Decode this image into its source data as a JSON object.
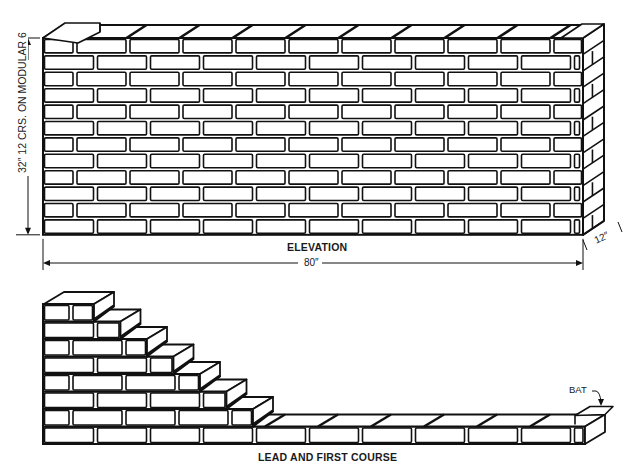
{
  "figure": {
    "elevation": {
      "caption": "ELEVATION",
      "height_dimension": "32″ 12 CRS. ON MODULAR 6",
      "length_dimension": "80″",
      "depth_dimension": "12″",
      "courses": 12,
      "origin": {
        "x": 43,
        "y": 38
      },
      "width": 540,
      "course_height": 16.4,
      "brick_length": 53,
      "head_joint": 4,
      "bed_joint": 3,
      "return_depth": {
        "dx": 21,
        "dy": -14
      }
    },
    "lead": {
      "caption": "LEAD AND FIRST COURSE",
      "bat_label": "BAT",
      "courses": 8,
      "origin": {
        "x": 43,
        "bottom": 444
      },
      "first_course_end_x": 585,
      "course_height": 17.5,
      "brick_length": 53,
      "step_per_course": 26.5,
      "depth": {
        "dx": 20,
        "dy": -12
      }
    },
    "colors": {
      "line": "#111111",
      "fill": "#ffffff",
      "joint": "#111111"
    }
  }
}
